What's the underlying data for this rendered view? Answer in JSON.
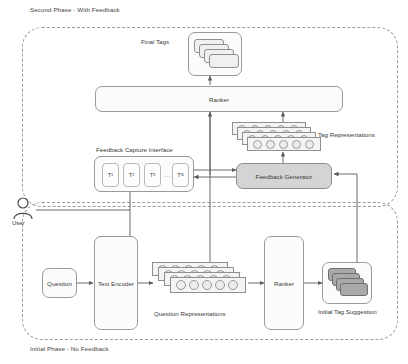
{
  "diagram": {
    "title_top": "Second Phase - With Feedback",
    "title_bottom": "Initial Phase - No Feedback",
    "colors": {
      "stroke": "#9a9a9a",
      "dashed_border": "#9b9b9b",
      "box_fill": "#fbfbfb",
      "gray_fill": "#d4d4d4",
      "dark_card": "#a9a9a9",
      "light_card": "#f0f0f0",
      "text": "#3a3a3a"
    }
  },
  "second_phase": {
    "final_tags_label": "Final Tags",
    "ranker_label": "Ranker",
    "tag_representations_label": "Tag Representations",
    "feedback_capture_label": "Feedback Capture Interface",
    "feedback_generator_label": "Feedback Generator",
    "tags": [
      {
        "base": "T",
        "sub": "1"
      },
      {
        "base": "T",
        "sub": "2"
      },
      {
        "base": "T",
        "sub": "3"
      },
      {
        "base": "T",
        "sub": "N"
      }
    ],
    "ellipsis": "...",
    "final_tags_card_count": 4,
    "tag_representation_slab_count": 4,
    "tag_representation_dots_per_slab": 5
  },
  "actor": {
    "label": "User",
    "icon": "person-icon"
  },
  "initial_phase": {
    "question_label": "Question",
    "text_encoder_label": "Text Encoder",
    "question_representations_label": "Question Representations",
    "ranker_label": "Ranker",
    "initial_tag_suggestion_label": "Initial Tag Suggestion",
    "question_representation_slab_count": 4,
    "question_representation_dots_per_slab": 5,
    "initial_tag_card_count": 4
  }
}
